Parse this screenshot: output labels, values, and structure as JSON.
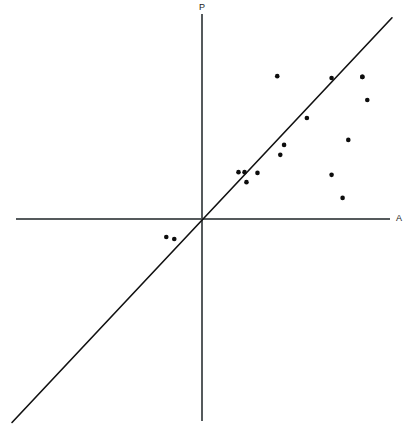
{
  "chart_data": {
    "type": "scatter",
    "title": "",
    "subtitle": "",
    "xlabel": "A",
    "ylabel": "P",
    "xtick_labels": [],
    "ytick_labels": [],
    "grid": false,
    "legend": null,
    "legend_position": "none",
    "xlim": [
      -5.0,
      5.0
    ],
    "ylim": [
      -5.3,
      5.3
    ],
    "annotations": [],
    "axes": {
      "x_axis_label": "A",
      "y_axis_label": "P",
      "x_axis_from": [
        -4.9,
        0
      ],
      "x_axis_to": [
        4.95,
        0
      ],
      "y_axis_from": [
        0,
        5.35
      ],
      "y_axis_to": [
        0,
        -5.25
      ],
      "origin_label": ""
    },
    "series": [
      {
        "name": "observations",
        "type": "scatter",
        "marker": "filled-circle",
        "marker_size_px": 4.6,
        "color": "#0d0d0d",
        "points": [
          {
            "x": -0.94,
            "y": -0.47
          },
          {
            "x": -0.73,
            "y": -0.52
          },
          {
            "x": 0.96,
            "y": 1.22
          },
          {
            "x": 1.12,
            "y": 1.22
          },
          {
            "x": 1.17,
            "y": 0.96
          },
          {
            "x": 1.46,
            "y": 1.2
          },
          {
            "x": 2.06,
            "y": 1.67
          },
          {
            "x": 2.16,
            "y": 1.93
          },
          {
            "x": 1.98,
            "y": 3.72
          },
          {
            "x": 2.76,
            "y": 2.63
          },
          {
            "x": 3.41,
            "y": 3.67
          },
          {
            "x": 3.41,
            "y": 1.15
          },
          {
            "x": 3.7,
            "y": 0.55
          },
          {
            "x": 3.85,
            "y": 2.06
          },
          {
            "x": 4.22,
            "y": 3.7
          },
          {
            "x": 4.35,
            "y": 3.1
          },
          {
            "x": 4.22,
            "y": 3.7
          }
        ]
      }
    ],
    "reference_line": {
      "name": "identity-line",
      "label": "",
      "type": "line",
      "slope": 1.0,
      "intercept": 0.0,
      "color": "#111111",
      "from": [
        -5.0,
        -5.3
      ],
      "to": [
        5.0,
        5.24
      ]
    }
  }
}
